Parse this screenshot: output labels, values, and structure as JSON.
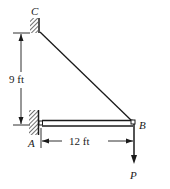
{
  "diagram": {
    "type": "statics-beam-cable",
    "points": {
      "A": {
        "label": "A"
      },
      "B": {
        "label": "B"
      },
      "C": {
        "label": "C"
      }
    },
    "dimensions": {
      "vertical": "9 ft",
      "horizontal": "12 ft"
    },
    "load": {
      "label": "P",
      "direction": "down"
    },
    "colors": {
      "line": "#1a1a1a",
      "background": "#ffffff"
    }
  }
}
